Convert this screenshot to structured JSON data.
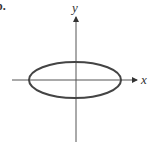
{
  "figure": {
    "label": "b.",
    "x_axis_label": "x",
    "y_axis_label": "y",
    "shape": "ellipse",
    "colors": {
      "axis": "#555555",
      "curve": "#444444",
      "text": "#333333"
    }
  }
}
